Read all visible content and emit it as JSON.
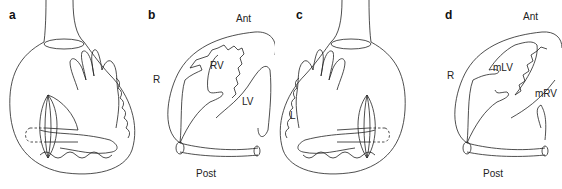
{
  "figure": {
    "panels": [
      {
        "id": "a",
        "label": "a",
        "view": "hand-in-chest illustration (right hand)"
      },
      {
        "id": "b",
        "label": "b",
        "view": "cardiac cross-section",
        "orientation": {
          "top": "Ant",
          "left": "R",
          "bottom": "Post"
        },
        "chambers": [
          "RV",
          "LV"
        ]
      },
      {
        "id": "c",
        "label": "c",
        "view": "hand-in-chest illustration (mirrored)",
        "orientation": {
          "left": "L"
        }
      },
      {
        "id": "d",
        "label": "d",
        "view": "cardiac cross-section",
        "orientation": {
          "top": "Ant",
          "left": "R",
          "bottom": "Post"
        },
        "chambers": [
          "mLV",
          "mRV"
        ]
      }
    ]
  }
}
